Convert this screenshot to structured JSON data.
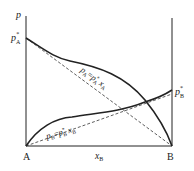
{
  "diagram": {
    "y_axis_label": "p",
    "x_axis_label": "x",
    "x_axis_label_sub": "B",
    "left_endpoint_label": "A",
    "right_endpoint_label": "B",
    "pA_star_label": "p",
    "pA_star_sub": "A",
    "pA_star_sup": "*",
    "pB_star_label": "p",
    "pB_star_sub": "B",
    "pB_star_sup": "*",
    "raoult_A_equation": "pA = p*A xA",
    "raoult_B_equation": "pB = p*B xB",
    "raoult_A_parts": {
      "p": "p",
      "sub1": "A",
      "eq": "=",
      "p2": "p",
      "sup2": "*",
      "sub2": "A",
      "x": "x",
      "sub3": "A"
    },
    "raoult_B_parts": {
      "p": "p",
      "sub1": "B",
      "eq": "=",
      "p2": "p",
      "sup2": "*",
      "sub2": "B",
      "x": "x",
      "sub3": "B"
    },
    "colors": {
      "line": "#222222",
      "background": "#ffffff"
    }
  }
}
